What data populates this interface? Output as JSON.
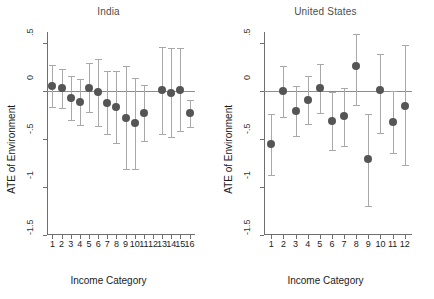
{
  "figure": {
    "ylabel": "ATE of Environment",
    "xlabel": "Income Category",
    "colors": {
      "point": "#555555",
      "errorbar": "#a8a8a8",
      "axis": "#6e6e6e",
      "zeroline": "#8c8c8c",
      "title": "#4d4d4d",
      "background": "#ffffff"
    }
  },
  "chart_data": [
    {
      "type": "scatter",
      "title": "India",
      "xlabel": "Income Category",
      "ylabel": "ATE of Environment",
      "ylim": [
        -1.5,
        0.62
      ],
      "yticks": [
        0.5,
        0,
        -0.5,
        -1,
        -1.5
      ],
      "ytick_labels": [
        ".5",
        "0",
        "-.5",
        "-1",
        "-1.5"
      ],
      "xlim": [
        0.4,
        16.6
      ],
      "grid": false,
      "legend": null,
      "zero_reference_line": 0,
      "categories": [
        1,
        2,
        3,
        4,
        5,
        6,
        7,
        8,
        9,
        10,
        11,
        12,
        13,
        14,
        15,
        16
      ],
      "xtick_labels": [
        "1",
        "2",
        "3",
        "4",
        "5",
        "6",
        "7",
        "8",
        "9",
        "10",
        "11",
        "12",
        "13",
        "14",
        "15",
        "16"
      ],
      "points": [
        {
          "x": 1,
          "y": 0.06,
          "ci_low": -0.16,
          "ci_high": 0.28
        },
        {
          "x": 2,
          "y": 0.03,
          "ci_low": -0.17,
          "ci_high": 0.23
        },
        {
          "x": 3,
          "y": -0.07,
          "ci_low": -0.3,
          "ci_high": 0.16
        },
        {
          "x": 4,
          "y": -0.11,
          "ci_low": -0.35,
          "ci_high": 0.13
        },
        {
          "x": 5,
          "y": 0.04,
          "ci_low": -0.22,
          "ci_high": 0.3
        },
        {
          "x": 6,
          "y": -0.01,
          "ci_low": -0.36,
          "ci_high": 0.34
        },
        {
          "x": 7,
          "y": -0.12,
          "ci_low": -0.45,
          "ci_high": 0.21
        },
        {
          "x": 8,
          "y": -0.16,
          "ci_low": -0.54,
          "ci_high": 0.21
        },
        {
          "x": 9,
          "y": -0.28,
          "ci_low": -0.81,
          "ci_high": 0.27
        },
        {
          "x": 10,
          "y": -0.33,
          "ci_low": -0.81,
          "ci_high": 0.14
        },
        {
          "x": 11,
          "y": -0.23,
          "ci_low": -0.52,
          "ci_high": 0.07
        },
        {
          "x": 13,
          "y": 0.01,
          "ci_low": -0.45,
          "ci_high": 0.46
        },
        {
          "x": 14,
          "y": -0.02,
          "ci_low": -0.48,
          "ci_high": 0.45
        },
        {
          "x": 15,
          "y": 0.01,
          "ci_low": -0.41,
          "ci_high": 0.45
        },
        {
          "x": 16,
          "y": -0.23,
          "ci_low": -0.37,
          "ci_high": -0.09
        }
      ]
    },
    {
      "type": "scatter",
      "title": "United States",
      "xlabel": "Income Category",
      "ylabel": "ATE of Environment",
      "ylim": [
        -1.5,
        0.62
      ],
      "yticks": [
        0.5,
        0,
        -0.5,
        -1,
        -1.5
      ],
      "ytick_labels": [
        ".5",
        "0",
        "-.5",
        "-1",
        "-1.5"
      ],
      "xlim": [
        0.4,
        12.6
      ],
      "grid": false,
      "legend": null,
      "zero_reference_line": 0,
      "categories": [
        1,
        2,
        3,
        4,
        5,
        6,
        7,
        8,
        9,
        10,
        11,
        12
      ],
      "xtick_labels": [
        "1",
        "2",
        "3",
        "4",
        "5",
        "6",
        "7",
        "8",
        "9",
        "10",
        "11",
        "12"
      ],
      "points": [
        {
          "x": 1,
          "y": -0.55,
          "ci_low": -0.87,
          "ci_high": -0.24
        },
        {
          "x": 2,
          "y": 0.0,
          "ci_low": -0.27,
          "ci_high": 0.27
        },
        {
          "x": 3,
          "y": -0.21,
          "ci_low": -0.47,
          "ci_high": 0.06
        },
        {
          "x": 4,
          "y": -0.09,
          "ci_low": -0.34,
          "ci_high": 0.16
        },
        {
          "x": 5,
          "y": 0.03,
          "ci_low": -0.23,
          "ci_high": 0.29
        },
        {
          "x": 6,
          "y": -0.31,
          "ci_low": -0.61,
          "ci_high": -0.01
        },
        {
          "x": 7,
          "y": -0.26,
          "ci_low": -0.57,
          "ci_high": 0.04
        },
        {
          "x": 8,
          "y": 0.26,
          "ci_low": -0.14,
          "ci_high": 0.6
        },
        {
          "x": 9,
          "y": -0.71,
          "ci_low": -1.2,
          "ci_high": -0.24
        },
        {
          "x": 10,
          "y": 0.01,
          "ci_low": -0.43,
          "ci_high": 0.39
        },
        {
          "x": 11,
          "y": -0.32,
          "ci_low": -0.64,
          "ci_high": 0.0
        },
        {
          "x": 12,
          "y": -0.15,
          "ci_low": -0.77,
          "ci_high": 0.48
        }
      ]
    }
  ]
}
